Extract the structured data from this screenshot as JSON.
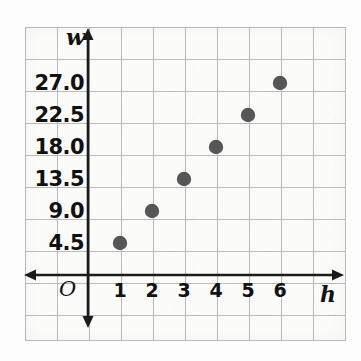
{
  "chart_data": {
    "type": "scatter",
    "title": "",
    "subtitle": "",
    "xlabel": "h",
    "ylabel": "w",
    "origin_label": "O",
    "x": [
      1,
      2,
      3,
      4,
      5,
      6
    ],
    "values": [
      4.5,
      9.0,
      13.5,
      18.0,
      22.5,
      27.0
    ],
    "points": [
      {
        "x": 1,
        "y": 4.5
      },
      {
        "x": 2,
        "y": 9.0
      },
      {
        "x": 3,
        "y": 13.5
      },
      {
        "x": 4,
        "y": 18.0
      },
      {
        "x": 5,
        "y": 22.5
      },
      {
        "x": 6,
        "y": 27.0
      }
    ],
    "xticklabels": [
      "1",
      "2",
      "3",
      "4",
      "5",
      "6"
    ],
    "yticklabels": [
      "4.5",
      "9.0",
      "13.5",
      "18.0",
      "22.5",
      "27.0"
    ],
    "xlim": [
      0,
      8
    ],
    "ylim": [
      0,
      31.5
    ],
    "grid": true,
    "legend": "none",
    "relationship": "w = 4.5h",
    "marker_color": "#575757",
    "axis_color": "#1a1a1a",
    "grid_color": "#b9b9b9",
    "background_color": "#fbfbfa"
  },
  "axes": {
    "y_label": "w",
    "x_label": "h",
    "origin": "O",
    "y_ticks": [
      {
        "label": "4.5",
        "value": 4.5
      },
      {
        "label": "9.0",
        "value": 9.0
      },
      {
        "label": "13.5",
        "value": 13.5
      },
      {
        "label": "18.0",
        "value": 18.0
      },
      {
        "label": "22.5",
        "value": 22.5
      },
      {
        "label": "27.0",
        "value": 27.0
      }
    ],
    "x_ticks": [
      {
        "label": "1",
        "value": 1
      },
      {
        "label": "2",
        "value": 2
      },
      {
        "label": "3",
        "value": 3
      },
      {
        "label": "4",
        "value": 4
      },
      {
        "label": "5",
        "value": 5
      },
      {
        "label": "6",
        "value": 6
      }
    ]
  }
}
